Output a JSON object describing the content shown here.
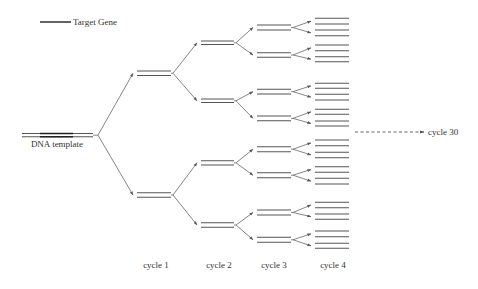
{
  "legend": {
    "label": "Target Gene",
    "line": [
      40,
      22,
      71,
      22
    ],
    "text_xy": [
      73,
      25
    ]
  },
  "template": {
    "label": "DNA template",
    "label_xy": [
      57,
      147
    ],
    "strands": [
      [
        22,
        133.5,
        93,
        133.5
      ],
      [
        22,
        136.8,
        93,
        136.8
      ]
    ],
    "target_segment": [
      40,
      73
    ]
  },
  "cycles": [
    {
      "label": "cycle 1",
      "label_xy": [
        156,
        268
      ]
    },
    {
      "label": "cycle 2",
      "label_xy": [
        219,
        268
      ]
    },
    {
      "label": "cycle 3",
      "label_xy": [
        274,
        268
      ]
    },
    {
      "label": "cycle 4",
      "label_xy": [
        333,
        268
      ]
    }
  ],
  "extrapolation": {
    "label": "cycle 30",
    "arrow": [
      355,
      132,
      424,
      132
    ],
    "text_xy": [
      428,
      135
    ]
  },
  "generations": [
    {
      "x1": 137,
      "x2": 171,
      "pair_ys": [
        [
          71,
          75.5
        ],
        [
          192.7,
          197.3
        ]
      ]
    },
    {
      "x1": 201,
      "x2": 234,
      "pair_ys": [
        [
          41,
          44.5
        ],
        [
          99,
          102.5
        ],
        [
          160.7,
          165
        ],
        [
          222.7,
          227.3
        ]
      ]
    },
    {
      "x1": 257,
      "x2": 291,
      "pair_ys": [
        [
          25,
          30
        ],
        [
          52.7,
          57.3
        ],
        [
          89.3,
          94
        ],
        [
          116,
          120.7
        ],
        [
          146.7,
          151.7
        ],
        [
          172.7,
          177.7
        ],
        [
          210,
          215
        ],
        [
          237.3,
          242.3
        ]
      ]
    },
    {
      "x1": 315,
      "x2": 349,
      "pair_ys": [
        [
          18.3,
          24
        ],
        [
          30,
          35.7
        ],
        [
          45,
          50.7
        ],
        [
          56.7,
          61.7
        ],
        [
          83.3,
          88.3
        ],
        [
          94.3,
          100
        ],
        [
          109.3,
          114.3
        ],
        [
          121,
          126
        ],
        [
          140,
          145.7
        ],
        [
          152.3,
          157.7
        ],
        [
          166.7,
          172.3
        ],
        [
          178.3,
          184
        ],
        [
          202.3,
          207.7
        ],
        [
          214,
          219.3
        ],
        [
          231,
          236.7
        ],
        [
          243.3,
          248.3
        ]
      ]
    }
  ],
  "colors": {
    "strand": "#555555",
    "target": "#222222",
    "arrow": "#666666",
    "text": "#333333"
  }
}
